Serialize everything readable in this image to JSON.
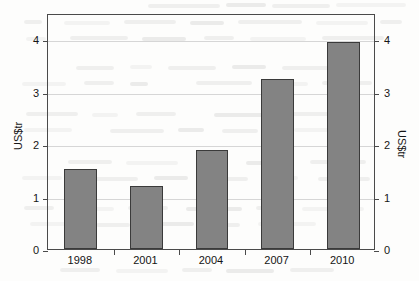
{
  "chart_data": {
    "type": "bar",
    "title": "",
    "subtitle": "",
    "xlabel": "",
    "ylabel": "US$tr",
    "ylabel_right": "US$tr",
    "categories": [
      "1998",
      "2001",
      "2004",
      "2007",
      "2010"
    ],
    "values": [
      1.52,
      1.21,
      1.88,
      3.25,
      3.95
    ],
    "series": [
      {
        "name": "",
        "values": [
          1.52,
          1.21,
          1.88,
          3.25,
          3.95
        ]
      }
    ],
    "ylim": [
      0,
      4.5
    ],
    "yticks": [
      0,
      1,
      2,
      3,
      4
    ],
    "ytick_labels": [
      "0",
      "1",
      "2",
      "3",
      "4"
    ],
    "yticks_right": [
      0,
      1,
      2,
      3,
      4
    ],
    "ytick_labels_right": [
      "0",
      "1",
      "2",
      "3",
      "4"
    ],
    "grid": true,
    "grid_axis": "y",
    "legend": false,
    "legend_position": "none",
    "bar_color": "#838383",
    "bar_border_color": "#3a3a3a",
    "gridline_color": "#d6d6d6",
    "axis_color": "#4a4a4a",
    "background_color": "#fdfdfc",
    "annotations": []
  },
  "figure": {
    "axis_title_left": "US$tr",
    "axis_title_right": "US$tr"
  }
}
